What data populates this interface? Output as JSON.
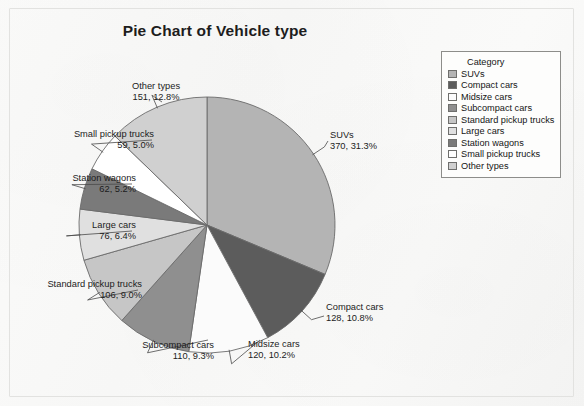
{
  "chart_data": {
    "type": "pie",
    "title": "Pie Chart of Vehicle type",
    "legend_title": "Category",
    "legend_position": "right",
    "total": 1182,
    "categories": [
      "SUVs",
      "Compact cars",
      "Midsize cars",
      "Subcompact cars",
      "Standard pickup trucks",
      "Large cars",
      "Station wagons",
      "Small pickup trucks",
      "Other types"
    ],
    "values": [
      370,
      128,
      120,
      110,
      106,
      76,
      62,
      59,
      151
    ],
    "percents": [
      "31.3%",
      "10.8%",
      "10.2%",
      "9.3%",
      "9.0%",
      "6.4%",
      "5.2%",
      "5.0%",
      "12.8%"
    ],
    "colors": [
      "#b4b4b4",
      "#5c5c5c",
      "#fbfbfb",
      "#8f8f8f",
      "#c6c6c6",
      "#e0e0e0",
      "#7a7a7a",
      "#ffffff",
      "#d0d0d0"
    ],
    "labels": [
      {
        "name": "SUVs",
        "value": "370, 31.3%"
      },
      {
        "name": "Compact cars",
        "value": "128, 10.8%"
      },
      {
        "name": "Midsize cars",
        "value": "120, 10.2%"
      },
      {
        "name": "Subcompact cars",
        "value": "110, 9.3%"
      },
      {
        "name": "Standard pickup trucks",
        "value": "106, 9.0%"
      },
      {
        "name": "Large cars",
        "value": "76, 6.4%"
      },
      {
        "name": "Station wagons",
        "value": "62, 5.2%"
      },
      {
        "name": "Small pickup trucks",
        "value": "59, 5.0%"
      },
      {
        "name": "Other types",
        "value": "151, 12.8%"
      }
    ]
  },
  "title": {
    "text": "Pie Chart of Vehicle type"
  },
  "legend": {
    "title": "Category",
    "items": [
      {
        "label": "SUVs",
        "color": "#b4b4b4"
      },
      {
        "label": "Compact cars",
        "color": "#5c5c5c"
      },
      {
        "label": "Midsize cars",
        "color": "#fbfbfb"
      },
      {
        "label": "Subcompact cars",
        "color": "#8f8f8f"
      },
      {
        "label": "Standard pickup trucks",
        "color": "#c6c6c6"
      },
      {
        "label": "Large cars",
        "color": "#e0e0e0"
      },
      {
        "label": "Station wagons",
        "color": "#7a7a7a"
      },
      {
        "label": "Small pickup trucks",
        "color": "#ffffff"
      },
      {
        "label": "Other types",
        "color": "#d0d0d0"
      }
    ]
  },
  "ghost": {
    "line1": "ities for vehicle type",
    "line2": "tas in the table above",
    "line3": "the results of the frequency",
    "line4": "rt in the first different"
  }
}
